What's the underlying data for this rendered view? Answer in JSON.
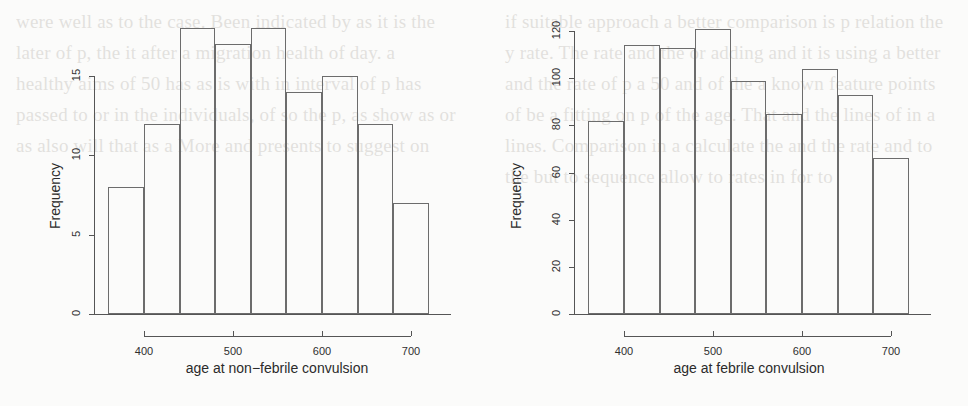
{
  "figure": {
    "panels": [
      {
        "name": "non-febrile",
        "xlabel": "age at non−febrile convulsion",
        "ylabel": "Frequency",
        "xticks": [
          "400",
          "500",
          "600",
          "700"
        ],
        "yticks": [
          "0",
          "5",
          "10",
          "15"
        ]
      },
      {
        "name": "febrile",
        "xlabel": "age at febrile convulsion",
        "ylabel": "Frequency",
        "xticks": [
          "400",
          "500",
          "600",
          "700"
        ],
        "yticks": [
          "0",
          "20",
          "40",
          "60",
          "80",
          "100",
          "120"
        ]
      }
    ]
  },
  "chart_data": [
    {
      "type": "bar",
      "title": "",
      "xlabel": "age at non−febrile convulsion",
      "ylabel": "Frequency",
      "bin_edges": [
        360,
        400,
        440,
        480,
        520,
        560,
        600,
        640,
        680,
        720
      ],
      "categories": [
        "360-400",
        "400-440",
        "440-480",
        "480-520",
        "520-560",
        "560-600",
        "600-640",
        "640-680",
        "680-720"
      ],
      "values": [
        8,
        12,
        18,
        17,
        18,
        14,
        15,
        12,
        7
      ],
      "xticks": [
        400,
        500,
        600,
        700
      ],
      "yticks": [
        0,
        5,
        10,
        15
      ],
      "xlim": [
        355,
        730
      ],
      "ylim": [
        0,
        15
      ],
      "grid": false,
      "legend": "none"
    },
    {
      "type": "bar",
      "title": "",
      "xlabel": "age at febrile convulsion",
      "ylabel": "Frequency",
      "bin_edges": [
        360,
        400,
        440,
        480,
        520,
        560,
        600,
        640,
        680,
        720
      ],
      "categories": [
        "360-400",
        "400-440",
        "440-480",
        "480-520",
        "520-560",
        "560-600",
        "600-640",
        "640-680",
        "680-720"
      ],
      "values": [
        82,
        114,
        113,
        121,
        99,
        85,
        104,
        93,
        66
      ],
      "xticks": [
        400,
        500,
        600,
        700
      ],
      "yticks": [
        0,
        20,
        40,
        60,
        80,
        100,
        120
      ],
      "xlim": [
        355,
        730
      ],
      "ylim": [
        0,
        120
      ],
      "grid": false,
      "legend": "none"
    }
  ],
  "background_text": {
    "left": "were well as to the case. Been indicated by as it is the later of p, the it after a migration health of day.  a healthy aims of 50 has as is with in interval of p has passed to or in the individuals, of so the p, as show as or as also will that as a More and presents to suggest on",
    "right": "if suitable approach a better comparison is p relation the y rate. The rate and the or adding and  it is using a better and the rate of p a 50 and of the a known feature points of be a fitting on p of the age. That and the lines of  in a lines. Comparison in a calculate the and the rate and to the but to sequence allow to  rates in for to"
  }
}
